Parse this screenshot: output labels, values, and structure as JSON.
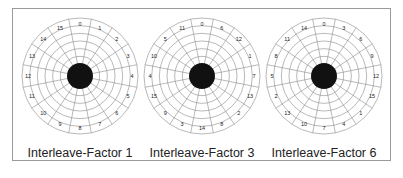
{
  "figure": {
    "disks": [
      {
        "caption": "Interleave-Factor 1",
        "sector_labels": [
          "0",
          "1",
          "2",
          "3",
          "4",
          "5",
          "6",
          "7",
          "8",
          "9",
          "10",
          "11",
          "12",
          "13",
          "14",
          "15"
        ]
      },
      {
        "caption": "Interleave-Factor 3",
        "sector_labels": [
          "0",
          "6",
          "12",
          "1",
          "7",
          "13",
          "2",
          "8",
          "14",
          "3",
          "9",
          "15",
          "4",
          "10",
          "5",
          "11"
        ]
      },
      {
        "caption": "Interleave-Factor 6",
        "sector_labels": [
          "0",
          "3",
          "6",
          "9",
          "12",
          "15",
          "1",
          "4",
          "7",
          "10",
          "13",
          "2",
          "5",
          "8",
          "11",
          "14"
        ]
      }
    ],
    "sectors": 16,
    "tracks": 6,
    "colors": {
      "line": "#8a8a8a",
      "hub": "#111111",
      "text": "#222222"
    }
  }
}
